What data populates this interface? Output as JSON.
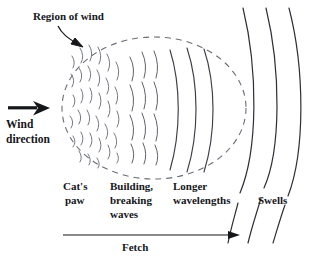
{
  "diagram": {
    "background_color": "#ffffff",
    "ink_color": "#15161a",
    "line_color": "#3c3f46",
    "labels": {
      "region_of_wind": "Region of wind",
      "wind_direction_line1": "Wind",
      "wind_direction_line2": "direction",
      "cats_paw_line1": "Cat's",
      "cats_paw_line2": "paw",
      "building_line1": "Building,",
      "building_line2": "breaking",
      "building_line3": "waves",
      "longer_line1": "Longer",
      "longer_line2": "wavelengths",
      "swells": "Swells",
      "fetch": "Fetch"
    },
    "annotations": {
      "region_of_wind_arrow": "curved-arrow-pointing-to-dashed-ellipse",
      "wind_direction_arrow": "thick-right-arrow",
      "fetch_arrow": "thin-right-arrow"
    },
    "zones": [
      {
        "name": "cats-paw",
        "description": "small broken ripple marks"
      },
      {
        "name": "building-waves",
        "description": "medium wavy broken crest lines"
      },
      {
        "name": "longer-waves",
        "description": "long smooth curved crest arcs"
      },
      {
        "name": "swells",
        "description": "three long smooth arcs outside wind region"
      }
    ],
    "ellipse": {
      "label": "region-of-wind-boundary",
      "style": "dashed",
      "cx": 154,
      "cy": 108,
      "rx": 92,
      "ry": 71
    }
  }
}
